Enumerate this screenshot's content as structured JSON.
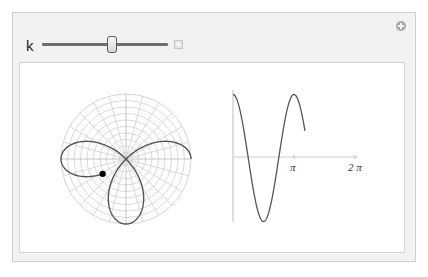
{
  "controls": {
    "k_label": "k",
    "k_value": 2,
    "slider": {
      "min": 1,
      "max": 3,
      "position_fraction": 0.55
    }
  },
  "icons": {
    "slider_expand": "plus-square-icon",
    "panel_options": "plus-circle-icon"
  },
  "chart_data": [
    {
      "type": "polar-line",
      "title": "",
      "function": "r = cos(k*theta)",
      "k": 2,
      "theta_range": [
        0,
        3.707
      ],
      "current_point": {
        "theta": 3.707,
        "r": 0.43
      },
      "grid": {
        "rings": 10,
        "radial_step_deg": 15
      },
      "rmax": 1
    },
    {
      "type": "line",
      "title": "",
      "function": "y = cos(k*theta)",
      "x_range": [
        0,
        3.707
      ],
      "x_axis_max": 6.283,
      "ticks": [
        {
          "value": 3.1416,
          "label": "π"
        },
        {
          "value": 6.2832,
          "label": "2 π"
        }
      ],
      "ylim": [
        -1,
        1
      ]
    }
  ],
  "tick_labels": {
    "pi": "π",
    "two_pi": "2 π"
  }
}
